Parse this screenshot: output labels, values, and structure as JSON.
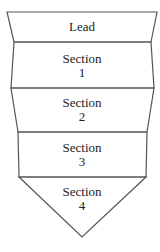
{
  "diagram": {
    "sections": [
      {
        "line1": "Lead",
        "line2": ""
      },
      {
        "line1": "Section",
        "line2": "1"
      },
      {
        "line1": "Section",
        "line2": "2"
      },
      {
        "line1": "Section",
        "line2": "3"
      },
      {
        "line1": "Section",
        "line2": "4"
      }
    ],
    "stroke_color": "#555555"
  }
}
